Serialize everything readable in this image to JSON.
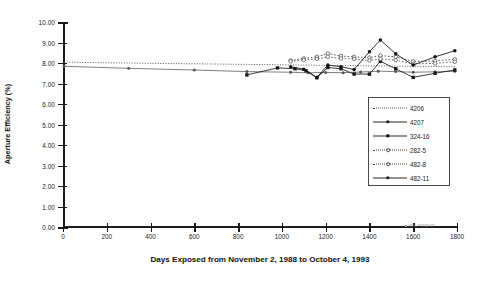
{
  "chart_data": {
    "type": "line",
    "title": "",
    "xlabel": "Days Exposed from November 2, 1988 to October 4, 1993",
    "ylabel": "Aperture Efficiency (%)",
    "xlim": [
      0,
      1800
    ],
    "ylim": [
      0,
      10
    ],
    "xticks": [
      0,
      200,
      400,
      600,
      800,
      1000,
      1200,
      1400,
      1600,
      1800
    ],
    "xtick_labels": [
      "0",
      "200",
      "400",
      "600",
      "800",
      "1000",
      "1200",
      "1400",
      "1600",
      "1800"
    ],
    "yticks": [
      0,
      1,
      2,
      3,
      4,
      5,
      6,
      7,
      8,
      9,
      10
    ],
    "ytick_labels": [
      "0.00",
      "1.00",
      "2.00",
      "3.00",
      "4.00",
      "5.00",
      "6.00",
      "7.00",
      "8.00",
      "9.00",
      "10.00"
    ],
    "grid": false,
    "legend_position": "inside-right",
    "series": [
      {
        "name": "4206",
        "style": "fine-dotted",
        "marker": "none",
        "color": "#4a4a4a",
        "x": [
          5,
          120,
          300,
          500,
          700,
          840,
          980,
          1050,
          1100,
          1150,
          1200,
          1260,
          1320,
          1380,
          1440,
          1500,
          1560,
          1620,
          1700,
          1790
        ],
        "y": [
          8.05,
          8.02,
          8.0,
          7.97,
          7.95,
          7.93,
          7.92,
          7.9,
          7.9,
          7.89,
          7.88,
          7.88,
          7.87,
          7.86,
          7.86,
          7.85,
          7.84,
          7.84,
          7.83,
          7.82
        ]
      },
      {
        "name": "4207",
        "style": "solid-thin",
        "marker": "filled-circle",
        "color": "#555555",
        "x": [
          5,
          300,
          600,
          840,
          1040,
          1120,
          1200,
          1280,
          1360,
          1440,
          1520,
          1600,
          1700,
          1790
        ],
        "y": [
          7.84,
          7.74,
          7.66,
          7.58,
          7.55,
          7.52,
          7.54,
          7.53,
          7.56,
          7.6,
          7.58,
          7.55,
          7.57,
          7.6
        ]
      },
      {
        "name": "324-16",
        "style": "solid",
        "marker": "filled-square",
        "color": "#1a1a1a",
        "x": [
          840,
          980,
          1060,
          1110,
          1160,
          1210,
          1270,
          1330,
          1400,
          1450,
          1520,
          1600,
          1700,
          1790
        ],
        "y": [
          7.42,
          7.76,
          7.72,
          7.62,
          7.28,
          7.78,
          7.72,
          7.46,
          7.46,
          8.08,
          7.72,
          7.3,
          7.5,
          7.66
        ]
      },
      {
        "name": "282-5",
        "style": "dotted",
        "marker": "open-circle",
        "color": "#3a3a3a",
        "x": [
          1040,
          1100,
          1160,
          1210,
          1270,
          1330,
          1400,
          1450,
          1520,
          1600,
          1700,
          1790
        ],
        "y": [
          8.12,
          8.22,
          8.3,
          8.46,
          8.34,
          8.3,
          8.26,
          8.36,
          8.3,
          8.08,
          8.1,
          8.18
        ]
      },
      {
        "name": "482-8",
        "style": "dotted",
        "marker": "open-circle",
        "color": "#4a4a4a",
        "x": [
          1040,
          1100,
          1160,
          1210,
          1270,
          1330,
          1400,
          1450,
          1520,
          1600,
          1700,
          1790
        ],
        "y": [
          8.08,
          8.14,
          8.2,
          8.3,
          8.22,
          8.2,
          8.12,
          8.2,
          8.14,
          7.96,
          7.98,
          8.06
        ]
      },
      {
        "name": "482-11",
        "style": "solid",
        "marker": "filled-circle",
        "color": "#111111",
        "x": [
          1040,
          1100,
          1160,
          1210,
          1270,
          1330,
          1400,
          1450,
          1520,
          1600,
          1700,
          1790
        ],
        "y": [
          7.82,
          7.7,
          7.3,
          7.9,
          7.82,
          7.68,
          8.55,
          9.12,
          8.45,
          7.9,
          8.3,
          8.6
        ]
      }
    ]
  },
  "legend": {
    "items": [
      {
        "label": "4206"
      },
      {
        "label": "4207"
      },
      {
        "label": "324-16"
      },
      {
        "label": "282-5"
      },
      {
        "label": "482-8"
      },
      {
        "label": "482-11"
      }
    ]
  },
  "annotations": {
    "stamp": "NREL PVMAT/NR"
  }
}
